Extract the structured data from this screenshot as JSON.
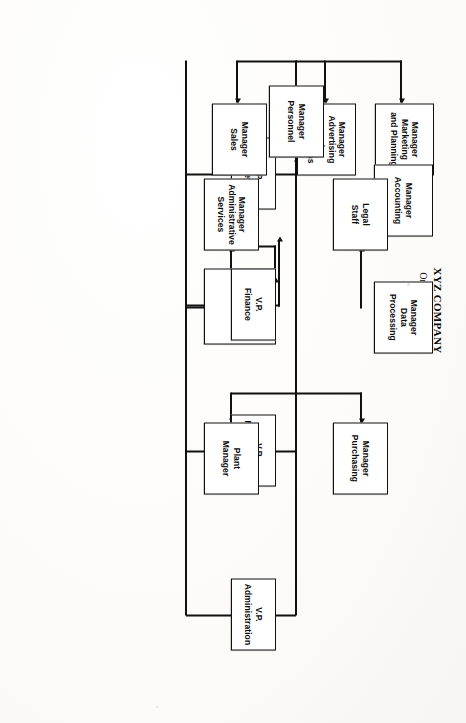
{
  "document": {
    "kind": "organization-chart",
    "orientation_note": "landscape chart scanned sideways (rotated 90 degrees clockwise)"
  },
  "title": {
    "company": "XYZ COMPANY",
    "subtitle": "Organization Chart",
    "year": "19XX"
  },
  "nodes": {
    "president": {
      "label": "President"
    },
    "vp_marketing": {
      "label": "V.P.\nMarketing"
    },
    "vp_finance": {
      "label": "V.P.\nFinance"
    },
    "vp_manufacturing": {
      "label": "V.P.\nManufacturing"
    },
    "vp_administration": {
      "label": "V.P.\nAdministration"
    },
    "mgr_marketing_planning": {
      "label": "Manager\nMarketing\nand Planning"
    },
    "mgr_advertising_promotions": {
      "label": "Manager\nAdvertising\nand\nPromotions"
    },
    "mgr_sales": {
      "label": "Manager\nSales"
    },
    "mgr_data_processing": {
      "label": "Manager\nData\nProcessing"
    },
    "mgr_accounting": {
      "label": "Manager\nAccounting"
    },
    "mgr_purchasing": {
      "label": "Manager\nPurchasing"
    },
    "plant_manager": {
      "label": "Plant\nManager"
    },
    "legal_staff": {
      "label": "Legal\nStaff"
    },
    "mgr_administrative_services": {
      "label": "Manager\nAdministrative\nServices"
    },
    "mgr_personnel": {
      "label": "Manager\nPersonnel"
    }
  },
  "hierarchy": [
    {
      "node": "president",
      "label": "President",
      "children": [
        {
          "node": "vp_marketing",
          "label": "V.P. Marketing",
          "children": [
            {
              "node": "mgr_marketing_planning",
              "label": "Manager Marketing and Planning"
            },
            {
              "node": "mgr_advertising_promotions",
              "label": "Manager Advertising and Promotions"
            },
            {
              "node": "mgr_sales",
              "label": "Manager Sales",
              "children": [
                {
                  "node": "mgr_data_processing",
                  "label": "Manager Data Processing"
                }
              ]
            }
          ]
        },
        {
          "node": "vp_finance",
          "label": "V.P. Finance",
          "children": [
            {
              "node": "mgr_accounting",
              "label": "Manager Accounting"
            }
          ]
        },
        {
          "node": "vp_manufacturing",
          "label": "V.P. Manufacturing",
          "children": [
            {
              "node": "mgr_purchasing",
              "label": "Manager Purchasing",
              "children": [
                {
                  "node": "legal_staff",
                  "label": "Legal Staff"
                }
              ]
            },
            {
              "node": "plant_manager",
              "label": "Plant Manager",
              "children": [
                {
                  "node": "mgr_administrative_services",
                  "label": "Manager Administrative Services"
                }
              ]
            }
          ]
        },
        {
          "node": "vp_administration",
          "label": "V.P. Administration",
          "children": [
            {
              "node": "mgr_personnel",
              "label": "Manager Personnel"
            }
          ]
        }
      ]
    }
  ],
  "style": {
    "box_border_color": "#111111",
    "connector_color": "#111111",
    "box_fill": "#ffffff",
    "page_background": "#fdfdfc"
  }
}
